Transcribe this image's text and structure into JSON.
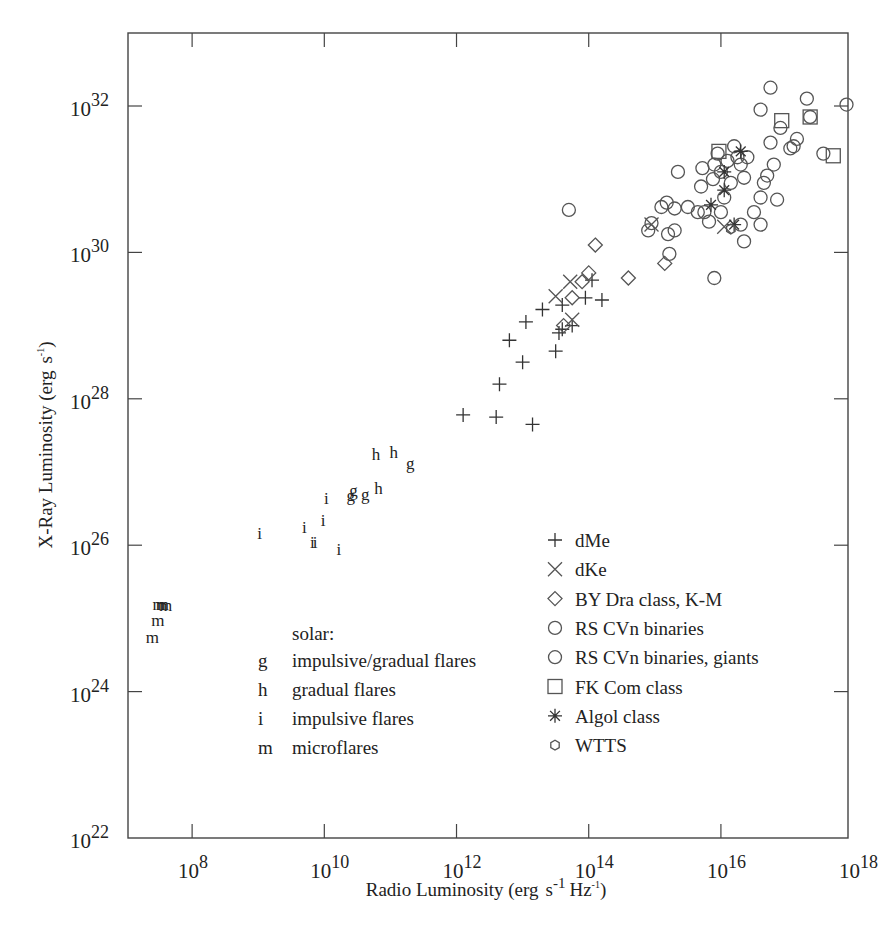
{
  "chart_data": {
    "type": "scatter",
    "title": "",
    "xlabel": "Radio Luminosity (erg s⁻¹ Hz⁻¹)",
    "ylabel": "X-Ray Luminosity (erg s⁻¹)",
    "xscale": "log",
    "yscale": "log",
    "xlim": [
      10700000.0,
      1e+18
    ],
    "ylim": [
      1e+22,
      1e+33
    ],
    "x_ticks": [
      {
        "base": "10",
        "exp": "8"
      },
      {
        "base": "10",
        "exp": "10"
      },
      {
        "base": "10",
        "exp": "12"
      },
      {
        "base": "10",
        "exp": "14"
      },
      {
        "base": "10",
        "exp": "16"
      },
      {
        "base": "10",
        "exp": "18"
      }
    ],
    "y_ticks": [
      {
        "base": "10",
        "exp": "22"
      },
      {
        "base": "10",
        "exp": "24"
      },
      {
        "base": "10",
        "exp": "26"
      },
      {
        "base": "10",
        "exp": "28"
      },
      {
        "base": "10",
        "exp": "30"
      },
      {
        "base": "10",
        "exp": "32"
      }
    ],
    "grid": false,
    "legend_position": "lower right (inside plot)",
    "solar_legend": {
      "heading": "solar:",
      "items": [
        {
          "symbol": "g",
          "label": "impulsive/gradual flares"
        },
        {
          "symbol": "h",
          "label": "gradual flares"
        },
        {
          "symbol": "i",
          "label": "impulsive flares"
        },
        {
          "symbol": "m",
          "label": "microflares"
        }
      ]
    },
    "stellar_legend": [
      {
        "marker": "plus",
        "label": "dMe"
      },
      {
        "marker": "x",
        "label": "dKe"
      },
      {
        "marker": "diamond",
        "label": "BY Dra class, K-M"
      },
      {
        "marker": "circle",
        "label": "RS CVn binaries"
      },
      {
        "marker": "circle",
        "label": "RS CVn binaries, giants"
      },
      {
        "marker": "square",
        "label": "FK Com class"
      },
      {
        "marker": "asterisk",
        "label": "Algol class"
      },
      {
        "marker": "hexagon",
        "label": "WTTS"
      }
    ],
    "series": [
      {
        "name": "microflares (m)",
        "marker": "m",
        "points": [
          {
            "logx": 7.5,
            "logy": 25.2
          },
          {
            "logx": 7.55,
            "logy": 25.2
          },
          {
            "logx": 7.6,
            "logy": 25.18
          },
          {
            "logx": 7.48,
            "logy": 24.98
          },
          {
            "logx": 7.4,
            "logy": 24.75
          }
        ]
      },
      {
        "name": "impulsive flares (i)",
        "marker": "i",
        "points": [
          {
            "logx": 9.02,
            "logy": 26.16
          },
          {
            "logx": 9.7,
            "logy": 26.25
          },
          {
            "logx": 9.82,
            "logy": 26.05
          },
          {
            "logx": 9.86,
            "logy": 26.05
          },
          {
            "logx": 9.98,
            "logy": 26.35
          },
          {
            "logx": 10.03,
            "logy": 26.65
          },
          {
            "logx": 10.22,
            "logy": 25.95
          }
        ]
      },
      {
        "name": "impulsive/gradual flares (g)",
        "marker": "g",
        "points": [
          {
            "logx": 10.4,
            "logy": 26.68
          },
          {
            "logx": 10.44,
            "logy": 26.75
          },
          {
            "logx": 10.62,
            "logy": 26.7
          },
          {
            "logx": 11.3,
            "logy": 27.12
          }
        ]
      },
      {
        "name": "gradual flares (h)",
        "marker": "h",
        "points": [
          {
            "logx": 10.78,
            "logy": 27.25
          },
          {
            "logx": 10.82,
            "logy": 26.78
          },
          {
            "logx": 11.05,
            "logy": 27.27
          }
        ]
      },
      {
        "name": "dMe",
        "marker": "plus",
        "points": [
          {
            "logx": 12.1,
            "logy": 27.78
          },
          {
            "logx": 12.6,
            "logy": 27.75
          },
          {
            "logx": 13.15,
            "logy": 27.65
          },
          {
            "logx": 12.65,
            "logy": 28.2
          },
          {
            "logx": 13.0,
            "logy": 28.5
          },
          {
            "logx": 12.8,
            "logy": 28.8
          },
          {
            "logx": 13.05,
            "logy": 29.05
          },
          {
            "logx": 13.3,
            "logy": 29.22
          },
          {
            "logx": 13.5,
            "logy": 28.65
          },
          {
            "logx": 13.55,
            "logy": 28.9
          },
          {
            "logx": 13.6,
            "logy": 28.95
          },
          {
            "logx": 13.75,
            "logy": 29.0
          },
          {
            "logx": 13.95,
            "logy": 29.38
          },
          {
            "logx": 14.2,
            "logy": 29.35
          },
          {
            "logx": 14.05,
            "logy": 29.62
          },
          {
            "logx": 13.6,
            "logy": 29.28
          }
        ]
      },
      {
        "name": "dKe",
        "marker": "x",
        "points": [
          {
            "logx": 13.5,
            "logy": 29.4
          },
          {
            "logx": 13.72,
            "logy": 29.6
          },
          {
            "logx": 13.75,
            "logy": 29.08
          },
          {
            "logx": 14.95,
            "logy": 30.38
          },
          {
            "logx": 16.05,
            "logy": 30.35
          }
        ]
      },
      {
        "name": "BY Dra class, K-M",
        "marker": "diamond",
        "points": [
          {
            "logx": 13.62,
            "logy": 29.0
          },
          {
            "logx": 13.75,
            "logy": 29.38
          },
          {
            "logx": 13.9,
            "logy": 29.6
          },
          {
            "logx": 14.0,
            "logy": 29.72
          },
          {
            "logx": 14.1,
            "logy": 30.1
          },
          {
            "logx": 14.6,
            "logy": 29.65
          },
          {
            "logx": 15.15,
            "logy": 29.85
          }
        ]
      },
      {
        "name": "RS CVn binaries (incl. giants)",
        "marker": "circle",
        "points": [
          {
            "logx": 13.7,
            "logy": 30.58
          },
          {
            "logx": 14.9,
            "logy": 30.3
          },
          {
            "logx": 14.95,
            "logy": 30.4
          },
          {
            "logx": 15.1,
            "logy": 30.62
          },
          {
            "logx": 15.18,
            "logy": 30.68
          },
          {
            "logx": 15.3,
            "logy": 30.6
          },
          {
            "logx": 15.35,
            "logy": 31.1
          },
          {
            "logx": 15.2,
            "logy": 30.25
          },
          {
            "logx": 15.22,
            "logy": 29.98
          },
          {
            "logx": 15.3,
            "logy": 30.3
          },
          {
            "logx": 15.5,
            "logy": 30.62
          },
          {
            "logx": 15.65,
            "logy": 30.55
          },
          {
            "logx": 15.7,
            "logy": 30.9
          },
          {
            "logx": 15.72,
            "logy": 31.15
          },
          {
            "logx": 15.75,
            "logy": 30.55
          },
          {
            "logx": 15.82,
            "logy": 30.42
          },
          {
            "logx": 15.88,
            "logy": 31.0
          },
          {
            "logx": 15.9,
            "logy": 31.2
          },
          {
            "logx": 15.95,
            "logy": 31.35
          },
          {
            "logx": 16.0,
            "logy": 31.1
          },
          {
            "logx": 16.0,
            "logy": 30.55
          },
          {
            "logx": 16.05,
            "logy": 30.75
          },
          {
            "logx": 16.1,
            "logy": 31.25
          },
          {
            "logx": 16.15,
            "logy": 30.95
          },
          {
            "logx": 16.2,
            "logy": 31.45
          },
          {
            "logx": 16.25,
            "logy": 31.3
          },
          {
            "logx": 16.3,
            "logy": 31.2
          },
          {
            "logx": 16.3,
            "logy": 30.38
          },
          {
            "logx": 16.35,
            "logy": 31.02
          },
          {
            "logx": 16.4,
            "logy": 31.3
          },
          {
            "logx": 16.5,
            "logy": 30.55
          },
          {
            "logx": 16.6,
            "logy": 30.75
          },
          {
            "logx": 16.65,
            "logy": 30.95
          },
          {
            "logx": 16.6,
            "logy": 30.38
          },
          {
            "logx": 16.7,
            "logy": 31.05
          },
          {
            "logx": 16.75,
            "logy": 31.5
          },
          {
            "logx": 16.8,
            "logy": 31.2
          },
          {
            "logx": 16.85,
            "logy": 30.72
          },
          {
            "logx": 16.9,
            "logy": 31.7
          },
          {
            "logx": 17.05,
            "logy": 31.42
          },
          {
            "logx": 17.1,
            "logy": 31.45
          },
          {
            "logx": 17.15,
            "logy": 31.55
          },
          {
            "logx": 16.6,
            "logy": 31.95
          },
          {
            "logx": 16.75,
            "logy": 32.25
          },
          {
            "logx": 17.3,
            "logy": 32.1
          },
          {
            "logx": 17.35,
            "logy": 31.85
          },
          {
            "logx": 17.55,
            "logy": 31.35
          },
          {
            "logx": 17.9,
            "logy": 32.02
          },
          {
            "logx": 15.9,
            "logy": 29.65
          },
          {
            "logx": 16.35,
            "logy": 30.15
          }
        ]
      },
      {
        "name": "FK Com class",
        "marker": "square",
        "points": [
          {
            "logx": 15.97,
            "logy": 31.38
          },
          {
            "logx": 16.92,
            "logy": 31.8
          },
          {
            "logx": 17.35,
            "logy": 31.85
          },
          {
            "logx": 17.7,
            "logy": 31.32
          }
        ]
      },
      {
        "name": "Algol class",
        "marker": "asterisk",
        "points": [
          {
            "logx": 16.05,
            "logy": 31.1
          },
          {
            "logx": 16.05,
            "logy": 30.85
          },
          {
            "logx": 15.85,
            "logy": 30.65
          },
          {
            "logx": 16.3,
            "logy": 31.38
          },
          {
            "logx": 16.2,
            "logy": 30.38
          }
        ]
      },
      {
        "name": "WTTS",
        "marker": "hexagon",
        "points": [
          {
            "logx": 16.15,
            "logy": 30.32
          }
        ]
      }
    ]
  },
  "labels": {
    "xlabel_main": "Radio Luminosity (erg",
    "xlabel_s": "s",
    "xlabel_sup1": "-1",
    "xlabel_hz": "Hz",
    "xlabel_sup2": "-1",
    "xlabel_close": ")",
    "ylabel_main": "X-Ray Luminosity (erg",
    "ylabel_s": "s",
    "ylabel_sup": "-1",
    "ylabel_close": ")"
  }
}
